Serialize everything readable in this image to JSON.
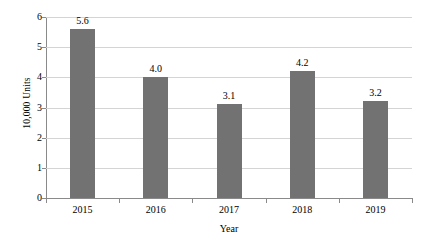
{
  "chart_data": {
    "type": "bar",
    "title": "",
    "xlabel": "Year",
    "ylabel": "10,000 Units",
    "categories": [
      "2015",
      "2016",
      "2017",
      "2018",
      "2019"
    ],
    "values": [
      5.6,
      4.0,
      3.1,
      4.2,
      3.2
    ],
    "value_labels": [
      "5.6",
      "4.0",
      "3.1",
      "4.2",
      "3.2"
    ],
    "ylim": [
      0,
      6
    ],
    "yticks": [
      0,
      1,
      2,
      3,
      4,
      5,
      6
    ],
    "ytick_labels": [
      "0",
      "1",
      "2",
      "3",
      "4",
      "5",
      "6"
    ],
    "grid": "horizontal",
    "legend": "none",
    "series": [
      {
        "name": "Units",
        "values": [
          5.6,
          4.0,
          3.1,
          4.2,
          3.2
        ]
      }
    ],
    "colors": {
      "bar": "#727272",
      "gridline": "#d4d4d4",
      "axis": "#8a8a8a",
      "background": "#ffffff",
      "text": "#000000"
    }
  }
}
